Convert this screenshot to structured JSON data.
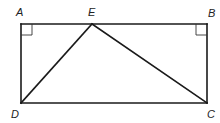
{
  "diagram": {
    "type": "geometry",
    "points": [
      {
        "id": "A",
        "label": "A",
        "x": 21,
        "y": 24,
        "label_x": 16,
        "label_y": 16
      },
      {
        "id": "E",
        "label": "E",
        "x": 92,
        "y": 24,
        "label_x": 88,
        "label_y": 16
      },
      {
        "id": "B",
        "label": "B",
        "x": 207,
        "y": 24,
        "label_x": 208,
        "label_y": 17
      },
      {
        "id": "C",
        "label": "C",
        "x": 207,
        "y": 103,
        "label_x": 207,
        "label_y": 118
      },
      {
        "id": "D",
        "label": "D",
        "x": 21,
        "y": 103,
        "label_x": 11,
        "label_y": 118
      }
    ],
    "segments": [
      {
        "from": "A",
        "to": "B"
      },
      {
        "from": "B",
        "to": "C"
      },
      {
        "from": "C",
        "to": "D"
      },
      {
        "from": "D",
        "to": "A"
      },
      {
        "from": "E",
        "to": "D"
      },
      {
        "from": "E",
        "to": "C"
      }
    ],
    "right_angle_markers": [
      {
        "at": "A",
        "size": 11
      },
      {
        "at": "B",
        "size": 11
      }
    ],
    "colors": {
      "stroke": "#1a1a1a",
      "label": "#222222",
      "background": "#ffffff"
    }
  }
}
